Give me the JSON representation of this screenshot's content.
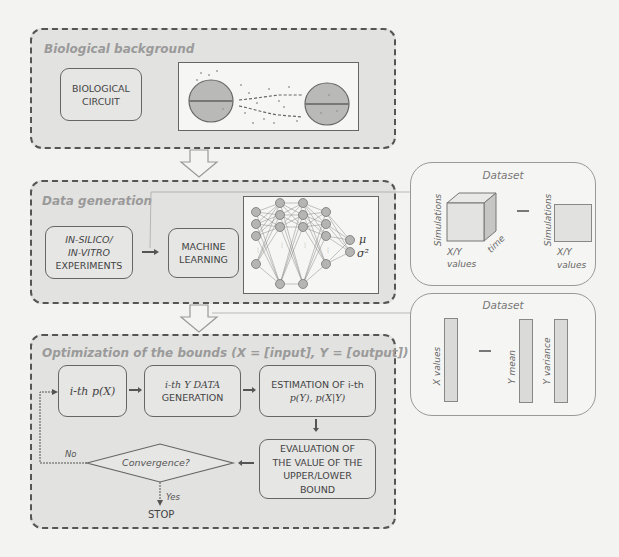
{
  "sections": {
    "bio": {
      "title": "Biological background",
      "circuit_label_1": "BIOLOGICAL",
      "circuit_label_2": "CIRCUIT"
    },
    "datagen": {
      "title": "Data generation",
      "experiments_1": "IN-SILICO/",
      "experiments_2": "IN-VITRO",
      "experiments_3": "EXPERIMENTS",
      "ml_1": "MACHINE",
      "ml_2": "LEARNING",
      "nn_out_mu": "μ",
      "nn_out_sigma": "σ²"
    },
    "optim": {
      "title": "Optimization of the bounds (X = [input], Y = [output])",
      "step1": "i-th p(X)",
      "step2_1": "i-th Y DATA",
      "step2_2": "GENERATION",
      "step3_1": "ESTIMATION OF i-th",
      "step3_2": "p(Y), p(X|Y)",
      "step4_1": "EVALUATION OF",
      "step4_2": "THE VALUE OF THE",
      "step4_3": "UPPER/LOWER",
      "step4_4": "BOUND",
      "decision": "Convergence?",
      "no_label": "No",
      "yes_label": "Yes",
      "stop_label": "STOP"
    }
  },
  "datasets": {
    "first": {
      "title": "Dataset",
      "cube_side": "Simulations",
      "cube_bottom_1": "X/Y",
      "cube_bottom_2": "values",
      "cube_depth": "time",
      "square_side": "Simulations",
      "square_bottom_1": "X/Y",
      "square_bottom_2": "values"
    },
    "second": {
      "title": "Dataset",
      "col1": "X values",
      "col2": "Y mean",
      "col3": "Y variance"
    }
  }
}
